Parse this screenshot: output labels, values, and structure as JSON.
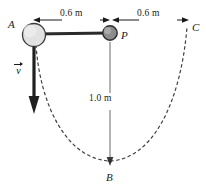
{
  "figure": {
    "background": "#ffffff",
    "stroke_color": "#1a1a1a",
    "dash_color": "#4a4a4a",
    "ball_a_fill": "#e2e2e2",
    "ball_p_fill": "#8c8c8c",
    "rod_color": "#2b2b2b"
  },
  "labels": {
    "point_a": "A",
    "point_p": "P",
    "point_b": "B",
    "point_c": "C",
    "velocity": "v"
  },
  "dimensions": {
    "top_left": "0.6 m",
    "top_right": "0.6 m",
    "vertical": "1.0 m"
  }
}
